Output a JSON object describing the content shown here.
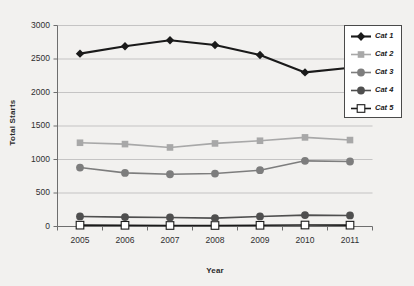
{
  "chart_data": {
    "type": "line",
    "title": "",
    "xlabel": "Year",
    "ylabel": "Total Starts",
    "categories": [
      "2005",
      "2006",
      "2007",
      "2008",
      "2009",
      "2010",
      "2011"
    ],
    "x": [
      2005,
      2006,
      2007,
      2008,
      2009,
      2010,
      2011
    ],
    "ylim": [
      0,
      3000
    ],
    "ytick_labels": [
      "0",
      "500",
      "1000",
      "1500",
      "2000",
      "2500",
      "3000"
    ],
    "yticks": [
      0,
      500,
      1000,
      1500,
      2000,
      2500,
      3000
    ],
    "grid": true,
    "legend_position": "top-right",
    "series": [
      {
        "name": "Cat 1",
        "values": [
          2580,
          2690,
          2780,
          2710,
          2560,
          2300,
          2370
        ],
        "color": "#1a1a1a",
        "marker": "diamond"
      },
      {
        "name": "Cat 2",
        "values": [
          1250,
          1230,
          1180,
          1240,
          1280,
          1330,
          1290
        ],
        "color": "#a8a8a8",
        "marker": "square"
      },
      {
        "name": "Cat 3",
        "values": [
          880,
          800,
          780,
          790,
          840,
          980,
          970
        ],
        "color": "#7d7d7d",
        "marker": "circle"
      },
      {
        "name": "Cat 4",
        "values": [
          150,
          140,
          135,
          125,
          150,
          170,
          165
        ],
        "color": "#4f4f4f",
        "marker": "circle"
      },
      {
        "name": "Cat 5",
        "values": [
          20,
          18,
          15,
          15,
          18,
          22,
          20
        ],
        "color": "#ffffff",
        "marker": "square-open"
      }
    ]
  },
  "legend": {
    "items": [
      {
        "label": "Cat 1"
      },
      {
        "label": "Cat 2"
      },
      {
        "label": "Cat 3"
      },
      {
        "label": "Cat 4"
      },
      {
        "label": "Cat 5"
      }
    ]
  }
}
